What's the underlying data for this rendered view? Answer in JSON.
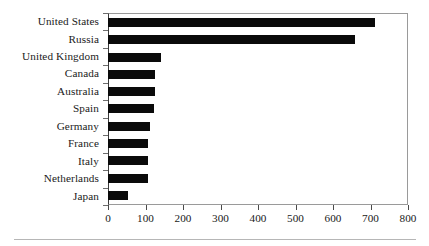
{
  "chart_data": {
    "type": "bar",
    "orientation": "horizontal",
    "title": "",
    "subtitle": "",
    "xlabel": "",
    "ylabel": "",
    "categories": [
      "United States",
      "Russia",
      "United Kingdom",
      "Canada",
      "Australia",
      "Spain",
      "Germany",
      "France",
      "Italy",
      "Netherlands",
      "Japan"
    ],
    "values": [
      710,
      655,
      138,
      123,
      122,
      120,
      108,
      104,
      104,
      104,
      51
    ],
    "series": [
      {
        "name": "",
        "values": [
          710,
          655,
          138,
          123,
          122,
          120,
          108,
          104,
          104,
          104,
          51
        ]
      }
    ],
    "xlim": [
      0,
      800
    ],
    "xticks": [
      0,
      100,
      200,
      300,
      400,
      500,
      600,
      700,
      800
    ],
    "xtick_labels": [
      "0",
      "100",
      "200",
      "300",
      "400",
      "500",
      "600",
      "700",
      "800"
    ],
    "grid": false,
    "legend": false,
    "legend_position": "none",
    "bar_color": "#0a0a0a",
    "frame_color": "#9a9a9a",
    "background_color": "#ffffff"
  }
}
